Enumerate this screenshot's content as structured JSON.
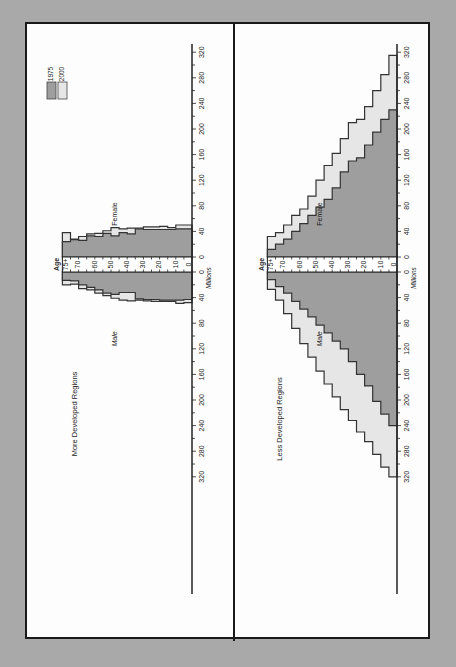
{
  "chart_data": {
    "type": "bar",
    "subtype": "population-pyramid",
    "orientation_note": "figure printed rotated 90 degrees counter-clockwise",
    "xlabel": "Millions",
    "ylabel": "Age",
    "age_groups": [
      "0",
      "5",
      "10",
      "15",
      "20",
      "25",
      "30",
      "35",
      "40",
      "45",
      "50",
      "55",
      "60",
      "65",
      "70",
      "75+"
    ],
    "age_tick_labels": [
      "0",
      "10",
      "20",
      "30",
      "40",
      "50",
      "60",
      "70",
      "75+"
    ],
    "axis_ticks": [
      "0",
      "40",
      "80",
      "120",
      "160",
      "200",
      "240",
      "280",
      "320"
    ],
    "xlim": [
      0,
      330
    ],
    "legend": [
      {
        "label": "1975",
        "color": "#9e9e9e"
      },
      {
        "label": "2000",
        "color": "#e6e6e6"
      }
    ],
    "side_labels": {
      "male": "Male",
      "female": "Female"
    },
    "panels": [
      {
        "title": "More Developed Regions",
        "series": [
          {
            "name": "1975",
            "sex": "Male",
            "values": [
              43,
              44,
              44,
              44,
              43,
              43,
              42,
              32,
              32,
              35,
              33,
              28,
              24,
              20,
              14,
              13
            ]
          },
          {
            "name": "2000",
            "sex": "Male",
            "values": [
              48,
              49,
              46,
              46,
              46,
              45,
              44,
              45,
              44,
              41,
              37,
              33,
              28,
              26,
              19,
              20
            ]
          },
          {
            "name": "1975",
            "sex": "Female",
            "values": [
              44,
              44,
              43,
              43,
              43,
              43,
              44,
              36,
              38,
              33,
              37,
              32,
              33,
              26,
              27,
              24
            ]
          },
          {
            "name": "2000",
            "sex": "Female",
            "values": [
              50,
              50,
              46,
              48,
              47,
              47,
              45,
              45,
              44,
              46,
              41,
              37,
              36,
              32,
              28,
              38
            ]
          }
        ]
      },
      {
        "title": "Less Developed Regions",
        "series": [
          {
            "name": "1975",
            "sex": "Male",
            "values": [
              240,
              222,
              202,
              178,
              160,
              140,
              120,
              108,
              95,
              83,
              70,
              58,
              46,
              33,
              23,
              12
            ]
          },
          {
            "name": "2000",
            "sex": "Male",
            "values": [
              320,
              305,
              285,
              265,
              250,
              232,
              215,
              195,
              175,
              155,
              133,
              112,
              88,
              65,
              44,
              27
            ]
          },
          {
            "name": "1975",
            "sex": "Female",
            "values": [
              230,
              215,
              195,
              175,
              155,
              150,
              133,
              108,
              90,
              78,
              65,
              52,
              40,
              28,
              20,
              12
            ]
          },
          {
            "name": "2000",
            "sex": "Female",
            "values": [
              315,
              285,
              260,
              235,
              215,
              210,
              185,
              162,
              143,
              120,
              95,
              75,
              65,
              50,
              38,
              32
            ]
          }
        ]
      }
    ]
  }
}
